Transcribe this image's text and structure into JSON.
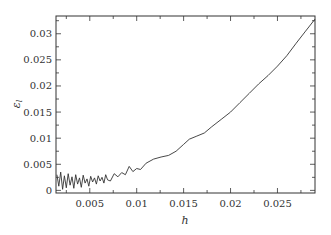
{
  "chart_data": {
    "type": "line",
    "title": "",
    "xlabel": "h",
    "ylabel": "ε_l",
    "xlim": [
      0.0014,
      0.029
    ],
    "ylim": [
      -0.0005,
      0.0334
    ],
    "grid": false,
    "legend": null,
    "x_ticks": [
      0.005,
      0.01,
      0.015,
      0.02,
      0.025
    ],
    "x_tick_labels": [
      "0.005",
      "0.01",
      "0.015",
      "0.02",
      "0.025"
    ],
    "y_ticks": [
      0,
      0.005,
      0.01,
      0.015,
      0.02,
      0.025,
      0.03
    ],
    "y_tick_labels": [
      "0",
      "0.005",
      "0.01",
      "0.015",
      "0.02",
      "0.025",
      "0.03"
    ],
    "series": [
      {
        "name": "error",
        "color": "#333333",
        "x": [
          0.0015,
          0.0017,
          0.0019,
          0.0021,
          0.0023,
          0.0025,
          0.0027,
          0.0029,
          0.0031,
          0.0033,
          0.0035,
          0.0037,
          0.0039,
          0.0041,
          0.0043,
          0.0045,
          0.0047,
          0.0049,
          0.0051,
          0.0053,
          0.0055,
          0.0057,
          0.0059,
          0.0061,
          0.0063,
          0.0065,
          0.0067,
          0.0069,
          0.0072,
          0.0076,
          0.008,
          0.0084,
          0.0088,
          0.0092,
          0.0096,
          0.01,
          0.0104,
          0.011,
          0.0118,
          0.0126,
          0.0134,
          0.0142,
          0.015,
          0.0156,
          0.0164,
          0.0172,
          0.018,
          0.019,
          0.02,
          0.021,
          0.022,
          0.023,
          0.024,
          0.025,
          0.026,
          0.027,
          0.028,
          0.029
        ],
        "y": [
          0.003,
          0.0008,
          0.0035,
          0.0002,
          0.0028,
          0.0005,
          0.0032,
          0.001,
          0.0026,
          0.0004,
          0.003,
          0.0012,
          0.0024,
          0.0006,
          0.0029,
          0.0014,
          0.0022,
          0.0008,
          0.0027,
          0.0016,
          0.0024,
          0.0012,
          0.0028,
          0.0018,
          0.0025,
          0.0014,
          0.003,
          0.002,
          0.0018,
          0.0032,
          0.0026,
          0.0034,
          0.003,
          0.0046,
          0.0036,
          0.0042,
          0.004,
          0.0052,
          0.006,
          0.0064,
          0.0067,
          0.0075,
          0.0088,
          0.0098,
          0.0104,
          0.011,
          0.0122,
          0.0136,
          0.015,
          0.0168,
          0.0186,
          0.0204,
          0.022,
          0.0238,
          0.0258,
          0.0282,
          0.0305,
          0.0328
        ]
      }
    ]
  }
}
